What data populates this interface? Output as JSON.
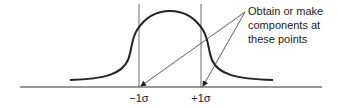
{
  "diagram": {
    "type": "normal-distribution",
    "annotation": {
      "lines": [
        "Obtain or make",
        "components at",
        "these points"
      ]
    },
    "axis_labels": {
      "minus_sigma": "−1σ",
      "plus_sigma": "+1σ"
    },
    "colors": {
      "curve": "#222222",
      "lines": "#333333",
      "text": "#222222"
    }
  }
}
